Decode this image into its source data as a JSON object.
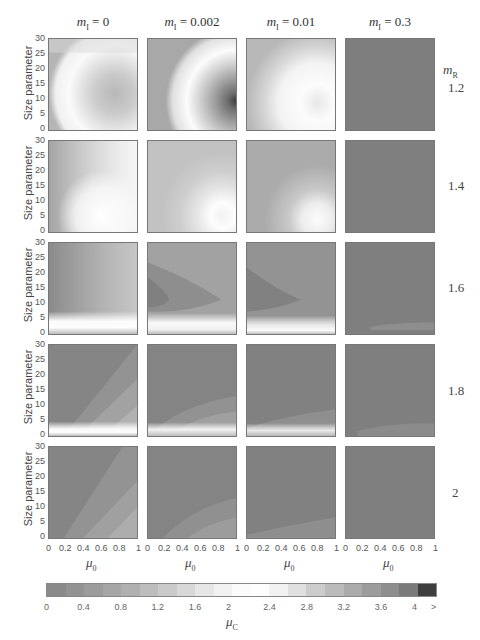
{
  "chart_data": {
    "type": "heatmap",
    "title": "",
    "layout": "5 rows x 4 columns grid of filled-contour panels",
    "xlabel": "μ0",
    "ylabel": "Size parameter",
    "xlim": [
      0,
      1
    ],
    "ylim": [
      0,
      30
    ],
    "x_ticks": [
      "0",
      "0.2",
      "0.4",
      "0.6",
      "0.8",
      "1"
    ],
    "y_ticks": [
      "0",
      "5",
      "10",
      "15",
      "20",
      "25",
      "30"
    ],
    "column_parameter": "mI",
    "columns": [
      "mI = 0",
      "mI = 0.002",
      "mI = 0.01",
      "mI = 0.3"
    ],
    "row_parameter": "mR",
    "rows": [
      "1.2",
      "1.4",
      "1.6",
      "1.8",
      "2"
    ],
    "colorbar": {
      "label": "μC",
      "ticks": [
        "0",
        "0.4",
        "0.8",
        "1.2",
        "1.6",
        "2",
        "2.4",
        "2.8",
        "3.2",
        "3.6",
        "4",
        ">"
      ],
      "range": [
        0,
        4.2
      ],
      "levels_step": 0.2,
      "colormap": "gray-white-gray-black (diverging around 2)"
    },
    "panels_description": [
      {
        "mR": "1.2",
        "mI": "0",
        "pattern": "white band at edges; grayish ellipse centered near size 12 at large μ0 (~μC 1.2–1.6)"
      },
      {
        "mR": "1.2",
        "mI": "0.002",
        "pattern": "white arc; dark core (>4) near size 10 at μ0≈1"
      },
      {
        "mR": "1.2",
        "mI": "0.01",
        "pattern": "white region at low sizes, light gray above; faint gray lobe near size 10 at μ0≈1"
      },
      {
        "mR": "1.2",
        "mI": "0.3",
        "pattern": "uniform medium gray (~μC 0.6)"
      },
      {
        "mR": "1.4",
        "mI": "0",
        "pattern": "vertical light bands, white near size 3–8"
      },
      {
        "mR": "1.4",
        "mI": "0.002",
        "pattern": "light gray, white near size 3–8 at large μ0"
      },
      {
        "mR": "1.4",
        "mI": "0.01",
        "pattern": "medium-light gray, white band near size 3–6"
      },
      {
        "mR": "1.4",
        "mI": "0.3",
        "pattern": "uniform medium gray"
      },
      {
        "mR": "1.6",
        "mI": "0",
        "pattern": "curved gray bands, darker lobe near size 10 at μ0≈0; white band near size 2"
      },
      {
        "mR": "1.6",
        "mI": "0.002",
        "pattern": "darker lobe at small μ0 near size 10; white band near size 2"
      },
      {
        "mR": "1.6",
        "mI": "0.01",
        "pattern": "darker lobe near size 10 at small μ0; white band near size 1"
      },
      {
        "mR": "1.6",
        "mI": "0.3",
        "pattern": "uniform gray, slight light streak near size 2 at large μ0"
      },
      {
        "mR": "1.8",
        "mI": "0",
        "pattern": "diagonal lighter wedge from lower-left; white band near size 1"
      },
      {
        "mR": "1.8",
        "mI": "0.002",
        "pattern": "dark gray with lighter curved region at bottom; white band near size 1"
      },
      {
        "mR": "1.8",
        "mI": "0.01",
        "pattern": "dark gray, light thin region at bottom"
      },
      {
        "mR": "1.8",
        "mI": "0.3",
        "pattern": "uniform gray, faint lighter strip near size 2"
      },
      {
        "mR": "2",
        "mI": "0",
        "pattern": "diagonal lighter wedge from lower-left"
      },
      {
        "mR": "2",
        "mI": "0.002",
        "pattern": "dark gray with lighter curved region at bottom right"
      },
      {
        "mR": "2",
        "mI": "0.01",
        "pattern": "dark gray, light region at bottom"
      },
      {
        "mR": "2",
        "mI": "0.3",
        "pattern": "uniform gray"
      }
    ]
  },
  "labels": {
    "columns": [
      {
        "m": "m",
        "sub": "I",
        "value": " = 0"
      },
      {
        "m": "m",
        "sub": "I",
        "value": " = 0.002"
      },
      {
        "m": "m",
        "sub": "I",
        "value": " = 0.01"
      },
      {
        "m": "m",
        "sub": "I",
        "value": " = 0.3"
      }
    ],
    "mr_label": {
      "m": "m",
      "sub": "R"
    },
    "rows": [
      "1.2",
      "1.4",
      "1.6",
      "1.8",
      "2"
    ],
    "y_axis_label": "Size parameter",
    "y_ticks": [
      "30",
      "25",
      "20",
      "15",
      "10",
      "5",
      "0"
    ],
    "x_ticks": [
      "0",
      "0.2",
      "0.4",
      "0.6",
      "0.8",
      "1"
    ],
    "x_label": {
      "m": "μ",
      "sub": "0"
    },
    "colorbar_ticks": [
      "0",
      "0.4",
      "0.8",
      "1.2",
      "1.6",
      "2",
      "2.4",
      "2.8",
      "3.2",
      "3.6",
      "4",
      ">"
    ],
    "colorbar_label": {
      "m": "μ",
      "sub": "C"
    }
  },
  "colors": {
    "base_gray": "#7e7e7e",
    "colorbar": [
      "#8a8a8a",
      "#939393",
      "#9c9c9c",
      "#a6a6a6",
      "#b0b0b0",
      "#bdbdbd",
      "#cacaca",
      "#d8d8d8",
      "#e6e6e6",
      "#f2f2f2",
      "#fbfbfb",
      "#fefefe",
      "#f2f2f2",
      "#e0e0e0",
      "#cccccc",
      "#bbbbbb",
      "#ababab",
      "#9c9c9c",
      "#8e8e8e",
      "#7a7a7a",
      "#3e3e3e"
    ]
  }
}
